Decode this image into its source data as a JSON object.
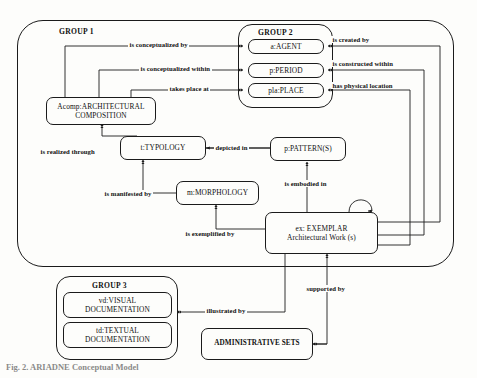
{
  "figure": {
    "caption": "Fig. 2. ARIADNE Conceptual Model"
  },
  "groups": [
    {
      "id": "group1",
      "label": "GROUP 1"
    },
    {
      "id": "group2",
      "label": "GROUP 2"
    },
    {
      "id": "group3",
      "label": "GROUP 3"
    }
  ],
  "entities": {
    "acomp": "Acomp:ARCHITECTURAL COMPOSITION",
    "typology": "t:TYPOLOGY",
    "morphology": "m:MORPHOLOGY",
    "pattern": "p:PATTERN(S)",
    "exemplar": "ex: EXEMPLAR Architectural Work (s)",
    "exemplar_line1": "ex: EXEMPLAR",
    "exemplar_line2": "Architectural Work (s)",
    "agent": "a:AGENT",
    "period": "p:PERIOD",
    "place": "pla:PLACE",
    "visual_doc": "vd:VISUAL DOCUMENTATION",
    "visual_doc_line1": "vd:VISUAL",
    "visual_doc_line2": "DOCUMENTATION",
    "textual_doc": "td:TEXTUAL DOCUMENTATION",
    "textual_doc_line1": "td:TEXTUAL",
    "textual_doc_line2": "DOCUMENTATION",
    "admin_sets": "ADMINISTRATIVE SETS",
    "acomp_line1": "Acomp:ARCHITECTURAL",
    "acomp_line2": "COMPOSITION"
  },
  "relations": {
    "is_conceptualized_by": "is conceptualized by",
    "is_conceptualized_within": "is conceptualized within",
    "takes_place_at": "takes place at",
    "is_created_by": "is created by",
    "is_constructed_within": "is constructed within",
    "has_physical_location": "has physical location",
    "is_realized_through": "is realized through",
    "depicted_in": "depicted in",
    "is_manifested_by": "is manifested by",
    "is_embodied_in": "is embodied in",
    "is_exemplified_by": "is exemplified by",
    "illustrated_by": "illustrated by",
    "supported_by": "supported by"
  },
  "colors": {
    "stroke": "#1b1b1b",
    "background": "#fdfdfb",
    "text": "#111111"
  }
}
